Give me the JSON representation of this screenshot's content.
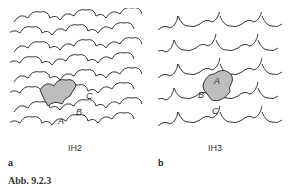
{
  "figure": {
    "caption": "Abb. 9.2.3",
    "panels": [
      {
        "letter": "a",
        "title": "IH2",
        "tile_labels": [
          "A",
          "B",
          "C"
        ],
        "shaded_color": "#bdbdbd"
      },
      {
        "letter": "b",
        "title": "IH3",
        "tile_labels": [
          "A",
          "B",
          "C"
        ],
        "shaded_color": "#bdbdbd"
      }
    ]
  }
}
